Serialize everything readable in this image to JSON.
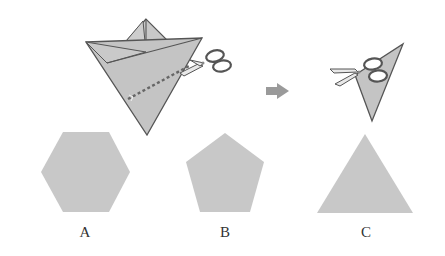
{
  "diagram": {
    "steps": [
      {
        "name": "folded-paper-with-cut-line",
        "description": "Folded paper with dashed cut line and scissors"
      },
      {
        "name": "arrow",
        "description": "Proceeds to next step"
      },
      {
        "name": "cut-result",
        "description": "Cut triangle piece with scissors"
      }
    ],
    "options": [
      {
        "label": "A",
        "shape": "hexagon"
      },
      {
        "label": "B",
        "shape": "pentagon"
      },
      {
        "label": "C",
        "shape": "triangle"
      }
    ],
    "colors": {
      "paper_fill": "#c4c4c4",
      "paper_stroke": "#555555",
      "answer_fill": "#c8c8c8",
      "arrow_fill": "#9a9a9a",
      "dash_color": "#666666"
    }
  }
}
